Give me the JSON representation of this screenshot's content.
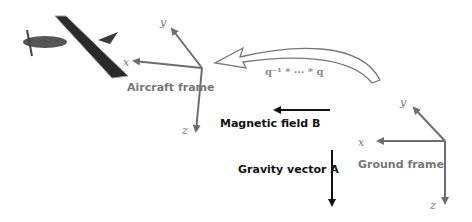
{
  "aircraft_frame": {
    "label": "Aircraft frame",
    "x": "x",
    "y": "y",
    "z": "z"
  },
  "ground_frame": {
    "label": "Ground frame",
    "x": "x",
    "y": "y",
    "z": "z"
  },
  "rotation": {
    "label": "q⁻¹ * ··· * q"
  },
  "magnetic": {
    "label": "Magnetic field B"
  },
  "gravity": {
    "label": "Gravity vector A"
  },
  "colors": {
    "axis": "#6e6e6e",
    "vector": "#111111"
  }
}
